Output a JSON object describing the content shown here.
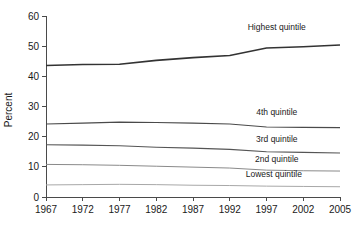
{
  "chart_data": {
    "type": "line",
    "title": "",
    "subtitle": "",
    "xlabel": "",
    "ylabel": "Percent",
    "x": [
      1967,
      1972,
      1977,
      1982,
      1987,
      1992,
      1997,
      2002,
      2005
    ],
    "xtick_labels": [
      "1967",
      "1972",
      "1977",
      "1982",
      "1987",
      "1992",
      "1997",
      "2002",
      "2005"
    ],
    "ytick_labels": [
      "0",
      "10",
      "20",
      "30",
      "40",
      "50",
      "60"
    ],
    "yticks": [
      0,
      10,
      20,
      30,
      40,
      50,
      60
    ],
    "xlim": [
      1967,
      2005
    ],
    "ylim": [
      0,
      60
    ],
    "grid": false,
    "legend_position": "inline-right",
    "series": [
      {
        "name": "Highest quintile",
        "label": "Highest quintile",
        "color": "#333333",
        "width": 1.6,
        "values": [
          43.6,
          43.9,
          44.0,
          45.3,
          46.2,
          46.9,
          49.4,
          49.8,
          50.4
        ]
      },
      {
        "name": "4th quintile",
        "label": "4th quintile",
        "color": "#4a4a4a",
        "width": 1.2,
        "values": [
          24.2,
          24.5,
          24.8,
          24.7,
          24.5,
          24.2,
          23.2,
          23.1,
          23.0
        ]
      },
      {
        "name": "3rd quintile",
        "label": "3rd quintile",
        "color": "#555555",
        "width": 1.1,
        "values": [
          17.3,
          17.2,
          17.0,
          16.5,
          16.2,
          15.8,
          15.0,
          14.8,
          14.6
        ]
      },
      {
        "name": "2nd quintile",
        "label": "2nd quintile",
        "color": "#8a8a8a",
        "width": 1.0,
        "values": [
          10.8,
          10.7,
          10.5,
          10.2,
          9.9,
          9.6,
          8.9,
          8.7,
          8.6
        ]
      },
      {
        "name": "Lowest quintile",
        "label": "Lowest quintile",
        "color": "#a8a8a8",
        "width": 1.0,
        "values": [
          4.0,
          4.1,
          4.2,
          4.1,
          3.9,
          3.8,
          3.6,
          3.5,
          3.4
        ]
      }
    ],
    "annotations": [
      {
        "text": "Highest quintile",
        "x": 1998.4,
        "y": 55.5
      },
      {
        "text": "4th quintile",
        "x": 1998.4,
        "y": 27.3
      },
      {
        "text": "3rd quintile",
        "x": 1998.4,
        "y": 18.2
      },
      {
        "text": "2nd quintile",
        "x": 1998.4,
        "y": 11.7
      },
      {
        "text": "Lowest quintile",
        "x": 1998.0,
        "y": 6.6
      }
    ]
  }
}
